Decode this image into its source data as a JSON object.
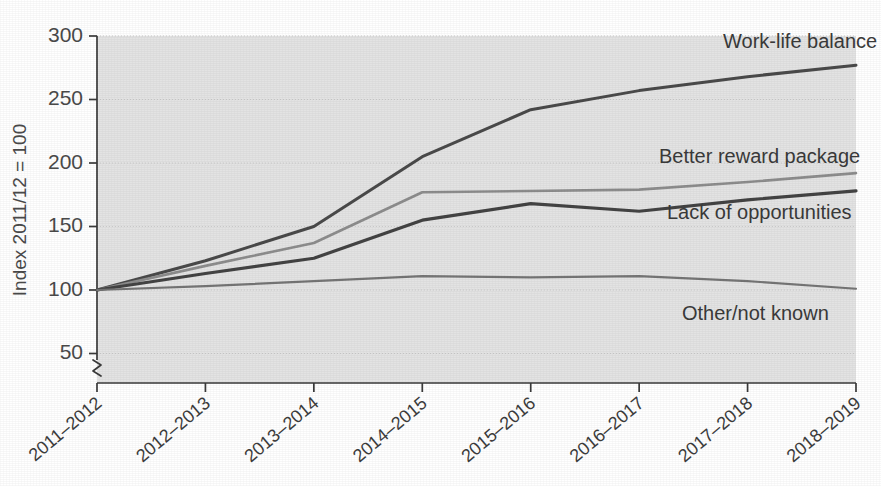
{
  "chart_data": {
    "type": "line",
    "title": "",
    "xlabel": "",
    "ylabel": "Index 2011/12 = 100",
    "categories": [
      "2011–2012",
      "2012–2013",
      "2013–2014",
      "2014–2015",
      "2015–2016",
      "2016–2017",
      "2017–2018",
      "2018–2019"
    ],
    "ylim": [
      50,
      300
    ],
    "yticks": [
      50,
      100,
      150,
      200,
      250,
      300
    ],
    "ytick_labels": [
      "50",
      "100",
      "150",
      "200",
      "250",
      "300"
    ],
    "y_axis_break": true,
    "grid": "horizontal",
    "legend": "inline-end-labels",
    "series": [
      {
        "name": "Work-life balance",
        "color": "#4a4a4a",
        "stroke_width": 3.0,
        "label_x": 723,
        "label_y": 48,
        "values": [
          100,
          123,
          150,
          205,
          242,
          257,
          268,
          277
        ]
      },
      {
        "name": "Better reward package",
        "color": "#8d8d8d",
        "stroke_width": 2.6,
        "label_x": 659,
        "label_y": 163,
        "values": [
          100,
          119,
          137,
          177,
          178,
          179,
          185,
          192
        ]
      },
      {
        "name": "Lack of opportunities",
        "color": "#434343",
        "stroke_width": 3.2,
        "label_x": 667,
        "label_y": 219,
        "values": [
          100,
          113,
          125,
          155,
          168,
          162,
          171,
          178
        ]
      },
      {
        "name": "Other/not known",
        "color": "#757575",
        "stroke_width": 2.2,
        "label_x": 682,
        "label_y": 320,
        "values": [
          100,
          103,
          107,
          111,
          110,
          111,
          107,
          101
        ]
      }
    ]
  },
  "axes": {
    "ylabel": "Index 2011/12 = 100",
    "ytick_labels": [
      "300",
      "250",
      "200",
      "150",
      "100",
      "50"
    ],
    "xtick_labels": [
      "2011–2012",
      "2012–2013",
      "2013–2014",
      "2014–2015",
      "2015–2016",
      "2016–2017",
      "2017–2018",
      "2018–2019"
    ]
  },
  "series_labels": [
    "Work-life balance",
    "Better reward package",
    "Lack of opportunities",
    "Other/not known"
  ],
  "colors": {
    "plot_background": "#e3e3e3",
    "page_background": "#ffffff",
    "axis": "#3a3a3a",
    "grid": "#c8c8c8"
  }
}
